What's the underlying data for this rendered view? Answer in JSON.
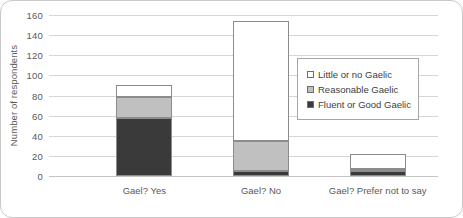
{
  "chart_data": {
    "type": "bar",
    "subtype": "stacked-bar",
    "title": "",
    "xlabel": "",
    "ylabel": "Number of respondents",
    "ylim": [
      0,
      160
    ],
    "ytick_step": 20,
    "yticks": [
      160,
      140,
      120,
      100,
      80,
      60,
      40,
      20,
      0
    ],
    "grid": true,
    "legend_position": "inside-upper-right",
    "categories": [
      "Gael? Yes",
      "Gael? No",
      "Gael? Prefer not to say"
    ],
    "series": [
      {
        "name": "Fluent or Good Gaelic",
        "color": "#3a3a3a",
        "values": [
          58,
          5,
          5
        ]
      },
      {
        "name": "Reasonable Gaelic",
        "color": "#c0c0c0",
        "values": [
          21,
          30,
          2
        ]
      },
      {
        "name": "Little or no Gaelic",
        "color": "#ffffff",
        "values": [
          11,
          119,
          15
        ]
      }
    ],
    "stack_order_bottom_to_top": [
      "Fluent or Good Gaelic",
      "Reasonable Gaelic",
      "Little or no Gaelic"
    ],
    "totals": [
      90,
      154,
      22
    ]
  },
  "legend": {
    "entries": [
      {
        "label": "Little or no Gaelic",
        "color": "#ffffff"
      },
      {
        "label": "Reasonable Gaelic",
        "color": "#c0c0c0"
      },
      {
        "label": "Fluent or Good Gaelic",
        "color": "#3a3a3a"
      }
    ]
  },
  "colors": {
    "border": "#c9c9c9",
    "gridline": "#d6d6d6",
    "text": "#595959",
    "bar_outline": "#8c8c8c"
  }
}
